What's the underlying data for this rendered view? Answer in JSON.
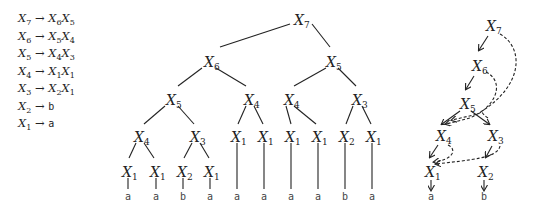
{
  "grammar": {
    "rules": [
      {
        "lhs": "X",
        "lhs_sub": "7",
        "rhs": [
          {
            "sym": "X",
            "sub": "6"
          },
          {
            "sym": "X",
            "sub": "5"
          }
        ]
      },
      {
        "lhs": "X",
        "lhs_sub": "6",
        "rhs": [
          {
            "sym": "X",
            "sub": "5"
          },
          {
            "sym": "X",
            "sub": "4"
          }
        ]
      },
      {
        "lhs": "X",
        "lhs_sub": "5",
        "rhs": [
          {
            "sym": "X",
            "sub": "4"
          },
          {
            "sym": "X",
            "sub": "3"
          }
        ]
      },
      {
        "lhs": "X",
        "lhs_sub": "4",
        "rhs": [
          {
            "sym": "X",
            "sub": "1"
          },
          {
            "sym": "X",
            "sub": "1"
          }
        ]
      },
      {
        "lhs": "X",
        "lhs_sub": "3",
        "rhs": [
          {
            "sym": "X",
            "sub": "2"
          },
          {
            "sym": "X",
            "sub": "1"
          }
        ]
      },
      {
        "lhs": "X",
        "lhs_sub": "2",
        "terminal": "b"
      },
      {
        "lhs": "X",
        "lhs_sub": "1",
        "terminal": "a"
      }
    ],
    "arrow": "→"
  },
  "derivation_tree": {
    "nodes": [
      {
        "id": "n7",
        "sym": "X",
        "sub": "7",
        "x": 300,
        "y": 20
      },
      {
        "id": "n6",
        "sym": "X",
        "sub": "6",
        "x": 210,
        "y": 62
      },
      {
        "id": "n5r",
        "sym": "X",
        "sub": "5",
        "x": 332,
        "y": 62
      },
      {
        "id": "n5",
        "sym": "X",
        "sub": "5",
        "x": 172,
        "y": 100
      },
      {
        "id": "n4a",
        "sym": "X",
        "sub": "4",
        "x": 250,
        "y": 100
      },
      {
        "id": "n4b",
        "sym": "X",
        "sub": "4",
        "x": 290,
        "y": 100
      },
      {
        "id": "n3a",
        "sym": "X",
        "sub": "3",
        "x": 358,
        "y": 100
      },
      {
        "id": "n4c",
        "sym": "X",
        "sub": "4",
        "x": 140,
        "y": 137
      },
      {
        "id": "n3b",
        "sym": "X",
        "sub": "3",
        "x": 196,
        "y": 137
      },
      {
        "id": "l5",
        "sym": "X",
        "sub": "1",
        "x": 237,
        "y": 137
      },
      {
        "id": "l6",
        "sym": "X",
        "sub": "1",
        "x": 264,
        "y": 137
      },
      {
        "id": "l7",
        "sym": "X",
        "sub": "1",
        "x": 291,
        "y": 137
      },
      {
        "id": "l8",
        "sym": "X",
        "sub": "1",
        "x": 318,
        "y": 137
      },
      {
        "id": "l9",
        "sym": "X",
        "sub": "2",
        "x": 345,
        "y": 137
      },
      {
        "id": "l10",
        "sym": "X",
        "sub": "1",
        "x": 372,
        "y": 137
      },
      {
        "id": "l1",
        "sym": "X",
        "sub": "1",
        "x": 128,
        "y": 172
      },
      {
        "id": "l2",
        "sym": "X",
        "sub": "1",
        "x": 156,
        "y": 172
      },
      {
        "id": "l3",
        "sym": "X",
        "sub": "2",
        "x": 183,
        "y": 172
      },
      {
        "id": "l4",
        "sym": "X",
        "sub": "1",
        "x": 210,
        "y": 172
      }
    ],
    "leaves": [
      {
        "ch": "a",
        "x": 128
      },
      {
        "ch": "a",
        "x": 156
      },
      {
        "ch": "b",
        "x": 183
      },
      {
        "ch": "a",
        "x": 210
      },
      {
        "ch": "a",
        "x": 237
      },
      {
        "ch": "a",
        "x": 264
      },
      {
        "ch": "a",
        "x": 291
      },
      {
        "ch": "a",
        "x": 318
      },
      {
        "ch": "b",
        "x": 345
      },
      {
        "ch": "a",
        "x": 372
      }
    ],
    "leaf_y": 200
  },
  "dag": {
    "nodes": [
      {
        "id": "d7",
        "sym": "X",
        "sub": "7",
        "x": 492,
        "y": 26
      },
      {
        "id": "d6",
        "sym": "X",
        "sub": "6",
        "x": 478,
        "y": 66
      },
      {
        "id": "d5",
        "sym": "X",
        "sub": "5",
        "x": 466,
        "y": 104
      },
      {
        "id": "d4",
        "sym": "X",
        "sub": "4",
        "x": 442,
        "y": 136
      },
      {
        "id": "d3",
        "sym": "X",
        "sub": "3",
        "x": 494,
        "y": 136
      },
      {
        "id": "d1",
        "sym": "X",
        "sub": "1",
        "x": 431,
        "y": 172
      },
      {
        "id": "d2",
        "sym": "X",
        "sub": "2",
        "x": 484,
        "y": 172
      }
    ],
    "leaves": [
      {
        "ch": "a",
        "x": 431
      },
      {
        "ch": "b",
        "x": 484
      }
    ],
    "leaf_y": 200
  }
}
